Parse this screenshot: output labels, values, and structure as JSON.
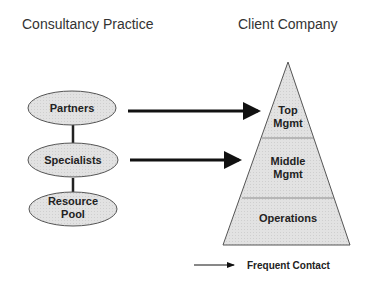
{
  "headings": {
    "left": "Consultancy Practice",
    "right": "Client Company"
  },
  "consultancy": {
    "nodes": [
      {
        "label_lines": [
          "Partners"
        ]
      },
      {
        "label_lines": [
          "Specialists"
        ]
      },
      {
        "label_lines": [
          "Resource",
          "Pool"
        ]
      }
    ]
  },
  "client": {
    "levels": [
      {
        "label_lines": [
          "Top",
          "Mgmt"
        ]
      },
      {
        "label_lines": [
          "Middle",
          "Mgmt"
        ]
      },
      {
        "label_lines": [
          "Operations"
        ]
      }
    ]
  },
  "legend": {
    "label": "Frequent Contact"
  },
  "colors": {
    "fill": "#e4e4e4",
    "stroke": "#555555",
    "arrow": "#111111"
  }
}
